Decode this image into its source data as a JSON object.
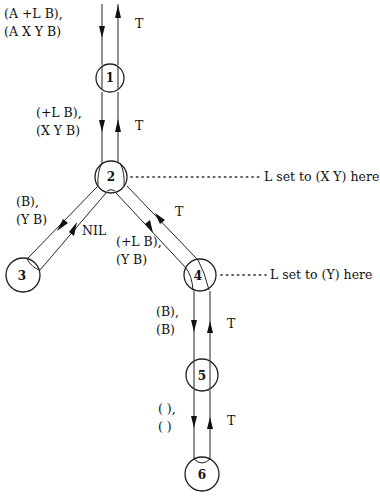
{
  "diagram": {
    "type": "recursion-tree",
    "nodes": [
      {
        "id": "1",
        "label": "1"
      },
      {
        "id": "2",
        "label": "2"
      },
      {
        "id": "3",
        "label": "3"
      },
      {
        "id": "4",
        "label": "4"
      },
      {
        "id": "5",
        "label": "5"
      },
      {
        "id": "6",
        "label": "6"
      }
    ],
    "edges": [
      {
        "from": "top",
        "to": "1",
        "down_label_1": "(A +L B),",
        "down_label_2": "(A X Y B)",
        "up_label": "T"
      },
      {
        "from": "1",
        "to": "2",
        "down_label_1": "(+L B),",
        "down_label_2": "(X Y B)",
        "up_label": "T"
      },
      {
        "from": "2",
        "to": "3",
        "down_label_1": "(B),",
        "down_label_2": "(Y B)",
        "up_label": "NIL"
      },
      {
        "from": "2",
        "to": "4",
        "down_label_1": "(+L B),",
        "down_label_2": "(Y B)",
        "up_label": "T"
      },
      {
        "from": "4",
        "to": "5",
        "down_label_1": "(B),",
        "down_label_2": "(B)",
        "up_label": "T"
      },
      {
        "from": "5",
        "to": "6",
        "down_label_1": "( ),",
        "down_label_2": "( )",
        "up_label": "T"
      }
    ],
    "annotations": [
      {
        "node": "2",
        "text": "L set to (X Y) here"
      },
      {
        "node": "4",
        "text": "L set to (Y) here"
      }
    ]
  }
}
